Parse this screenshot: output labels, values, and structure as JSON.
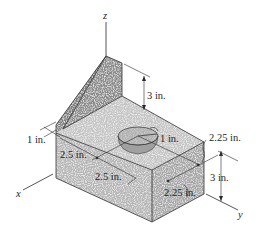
{
  "figure": {
    "type": "isometric engineering drawing",
    "axes": {
      "x_label": "x",
      "y_label": "y",
      "z_label": "z"
    },
    "dimensions": {
      "rib_height": "3 in.",
      "left_offset": "1 in.",
      "hole_radius": "1 in.",
      "x_segment_1": "2.5 in.",
      "x_segment_2": "2.5 in.",
      "y_offset_top": "2.25 in.",
      "y_offset_front": "2.25 in.",
      "block_height": "3 in."
    },
    "colors": {
      "rib_face": "#8a8a8a",
      "top_face": "#c4c4c4",
      "front_face": "#b3b3b3",
      "right_face": "#a4a4a4",
      "hole_inner": "#9b9b9b",
      "line": "#2a2a2a"
    }
  }
}
